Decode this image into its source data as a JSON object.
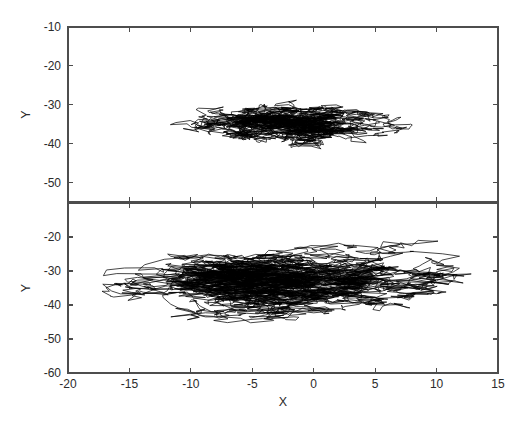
{
  "figure": {
    "title": "",
    "background_color": "#ffffff",
    "width": 527,
    "height": 434,
    "axis_color": "#4d4d4d",
    "trace_color": "#000000"
  },
  "chart_data": [
    {
      "type": "line",
      "name": "top-panel",
      "title": "",
      "xlabel": "",
      "ylabel": "Y",
      "xlim": [
        -20,
        15
      ],
      "ylim": [
        -55,
        -10
      ],
      "xticks": [
        -20,
        -15,
        -10,
        -5,
        0,
        5,
        10,
        15
      ],
      "xticklabels": [
        "",
        "",
        "",
        "",
        "",
        "",
        "",
        ""
      ],
      "yticks": [
        -10,
        -20,
        -30,
        -40,
        -50
      ],
      "yticklabels": [
        "-10",
        "-20",
        "-30",
        "-40",
        "-50"
      ],
      "grid": false,
      "legend": "none",
      "box": true,
      "description": "Dense overlapping random-walk trajectory centered near X = -1, Y = -35; horizontal spread roughly X = -12 to X = 9, vertical spread roughly Y = -53 to Y = -25.",
      "trajectory_center": {
        "x": -1.0,
        "y": -35.0
      },
      "trajectory_extent": {
        "xmin": -12.5,
        "xmax": 9.0,
        "ymin": -53.0,
        "ymax": -24.5
      },
      "point_count": 2600,
      "seed": 20417,
      "step_sigma": {
        "x": 0.62,
        "y": 0.5
      },
      "return_pull": 0.016
    },
    {
      "type": "line",
      "name": "bottom-panel",
      "title": "",
      "xlabel": "X",
      "ylabel": "Y",
      "xlim": [
        -20,
        15
      ],
      "ylim": [
        -60,
        -10
      ],
      "xticks": [
        -20,
        -15,
        -10,
        -5,
        0,
        5,
        10,
        15
      ],
      "xticklabels": [
        "-20",
        "-15",
        "-10",
        "-5",
        "0",
        "5",
        "10",
        "15"
      ],
      "yticks": [
        -20,
        -30,
        -40,
        -50,
        -60
      ],
      "yticklabels": [
        "-20",
        "-30",
        "-40",
        "-50",
        "-60"
      ],
      "grid": false,
      "legend": "none",
      "box": true,
      "description": "Dense overlapping random-walk trajectory centered near X = -2, Y = -33; wider horizontal spread roughly X = -19.5 to X = 13, vertical spread roughly Y = -52 to Y = -14.",
      "trajectory_center": {
        "x": -2.0,
        "y": -33.0
      },
      "trajectory_extent": {
        "xmin": -19.5,
        "xmax": 13.0,
        "ymin": -52.0,
        "ymax": -14.0
      },
      "point_count": 4200,
      "seed": 77231,
      "step_sigma": {
        "x": 0.95,
        "y": 0.72
      },
      "return_pull": 0.013
    }
  ],
  "axes": {
    "top": {
      "label_y": "Y",
      "tick_labels_y": [
        "-10",
        "-20",
        "-30",
        "-40",
        "-50"
      ]
    },
    "bottom": {
      "label_y": "Y",
      "label_x": "X",
      "tick_labels_y": [
        "-20",
        "-30",
        "-40",
        "-50",
        "-60"
      ],
      "tick_labels_x": [
        "-20",
        "-15",
        "-10",
        "-5",
        "0",
        "5",
        "10",
        "15"
      ]
    }
  }
}
